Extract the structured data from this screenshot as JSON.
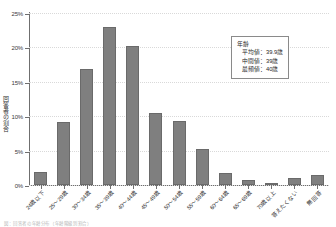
{
  "chart_data": {
    "type": "bar",
    "title": "",
    "xlabel": "",
    "ylabel": "回答者の割合",
    "ylim": [
      0,
      25
    ],
    "yunit": "%",
    "grid": true,
    "legend": "none",
    "orientation": "vertical",
    "bar_color": "#7f7f7f",
    "categories": [
      "24歳以下",
      "25～29歳",
      "30～34歳",
      "35～39歳",
      "40～44歳",
      "45～49歳",
      "50～54歳",
      "55～59歳",
      "60～64歳",
      "65～69歳",
      "70歳以上",
      "答えたくない",
      "無回答"
    ],
    "values": [
      1.9,
      9.2,
      16.8,
      23.0,
      20.2,
      10.5,
      9.3,
      5.3,
      1.7,
      0.7,
      0.3,
      1.0,
      1.5
    ],
    "yticks": [
      0,
      5,
      10,
      15,
      20,
      25
    ],
    "ytick_labels": [
      "0%",
      "5%",
      "10%",
      "15%",
      "20%",
      "25%"
    ]
  },
  "annotation": {
    "title": "年齢",
    "lines": [
      "平均値：39.9歳",
      "中間値：39歳",
      "最頻値：40歳"
    ]
  },
  "caption": {
    "text": "図：回答者の年齢分布（年齢階級別割合）"
  }
}
